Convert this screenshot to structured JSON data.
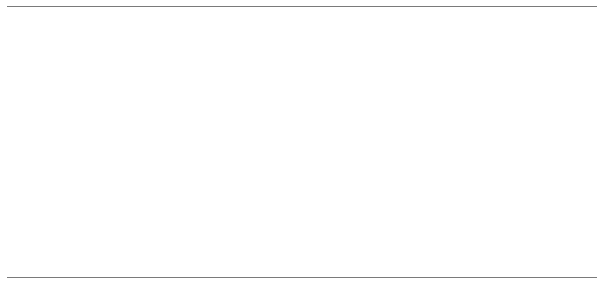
{
  "chart_data": {
    "type": "area",
    "title": "",
    "xlabel": "",
    "ylabel": "Annual car sales in millions",
    "xlim": [
      1965,
      1991
    ],
    "ylim": [
      0,
      11
    ],
    "grid": false,
    "legend_position": "inline-annotations",
    "x": [
      1965,
      1966,
      1967,
      1968,
      1969,
      1970,
      1971,
      1972,
      1973,
      1974,
      1975,
      1976,
      1977,
      1978,
      1979,
      1980,
      1981,
      1982,
      1983,
      1984,
      1985,
      1986,
      1987,
      1988,
      1989,
      1990,
      1991
    ],
    "series": [
      {
        "name": "Total U.S. auto sales",
        "label": "Total U.S. auto sales",
        "values": [
          9.3,
          9.0,
          8.3,
          9.3,
          9.3,
          8.4,
          10.0,
          10.5,
          11.2,
          8.55,
          8.55,
          10.0,
          11.0,
          11.1,
          10.5,
          8.95,
          8.5,
          7.95,
          9.1,
          10.2,
          11.1,
          11.25,
          10.15,
          10.4,
          9.7,
          9.1,
          8.3
        ]
      },
      {
        "name": "Sales of domestic producers",
        "label": "Sales of domestic producers",
        "values": [
          8.75,
          8.4,
          7.55,
          8.45,
          8.1,
          7.1,
          8.5,
          9.2,
          9.35,
          7.05,
          6.9,
          8.45,
          9.0,
          9.25,
          8.25,
          6.4,
          6.1,
          5.4,
          6.75,
          7.85,
          8.1,
          8.1,
          7.05,
          7.55,
          7.3,
          6.8,
          6.1
        ]
      }
    ],
    "yticks": [
      1,
      2,
      3,
      4,
      5,
      6,
      7,
      8,
      9,
      10,
      11
    ],
    "ytick_labels": [
      "1",
      "2",
      "3",
      "4",
      "5",
      "6",
      "7",
      "8",
      "9",
      "10",
      "11"
    ],
    "xticks": [
      1965,
      1967,
      1969,
      1971,
      1973,
      1975,
      1977,
      1979,
      1981,
      1983,
      1985,
      1987,
      1989,
      1991
    ],
    "xtick_labels": [
      "1965",
      "1967",
      "1969",
      "1971",
      "1973",
      "1975",
      "1977",
      "1979",
      "1981",
      "1983",
      "1985",
      "1987",
      "1989",
      "1991"
    ],
    "xtick_minor": [
      1966,
      1968,
      1970,
      1972,
      1974,
      1976,
      1978,
      1980,
      1982,
      1984,
      1986,
      1988,
      1990
    ],
    "annotations": [
      {
        "name": "total-sales-label",
        "text": "Total U.S. auto sales",
        "x": 82,
        "y": 31
      },
      {
        "name": "domestic-sales-label-line1",
        "text": "Sales of",
        "x": 131,
        "y": 131
      },
      {
        "name": "domestic-sales-label-line2",
        "text": "domestic producers",
        "x": 104,
        "y": 143
      }
    ],
    "recessions": [
      {
        "name": "recession-74-75",
        "line1": "Recession",
        "line2": "of '74-'75",
        "start": 1973,
        "end": 1975,
        "label_x": 225,
        "label_y1": 218,
        "label_y2": 230
      },
      {
        "name": "recession-79-82",
        "line1": "Recession",
        "line2": "of '79-'82",
        "start": 1979,
        "end": 1982,
        "label_x": 366,
        "label_y1": 218,
        "label_y2": 230
      },
      {
        "name": "recession-90-91",
        "line1": "Recession",
        "line2": "of '90-'91",
        "start": 1989,
        "end": 1991,
        "label_x": 543,
        "label_y1": 218,
        "label_y2": 230
      }
    ],
    "colors": {
      "line": "#1a1a1a",
      "fill": "#d9d9d9",
      "axis": "#3c3c3c",
      "rule": "#7a7a7a",
      "text": "#111111"
    }
  }
}
